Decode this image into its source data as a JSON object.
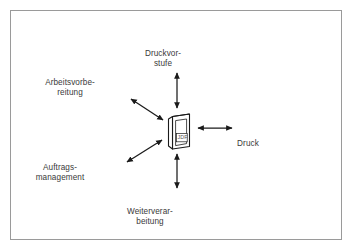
{
  "figure": {
    "type": "hub-and-spoke-diagram",
    "border_color": "#9a9a9a",
    "background_color": "#ffffff",
    "line_color": "#1a1a1a",
    "text_color": "#3a3a3a"
  },
  "center": {
    "icon_name": "jdf-document-icon",
    "label": "JDF"
  },
  "nodes": [
    {
      "id": "druckvorstufe",
      "line1": "Druckvor-",
      "line2": "stufe",
      "direction": "up",
      "x": 163,
      "y": 38
    },
    {
      "id": "arbeitsvorbereitung",
      "line1": "Arbeitsvorbe-",
      "line2": "reitung",
      "direction": "up-left",
      "x": 70,
      "y": 67
    },
    {
      "id": "druck",
      "line1": "Druck",
      "line2": "",
      "direction": "right",
      "x": 248,
      "y": 128
    },
    {
      "id": "auftragsmanagement",
      "line1": "Auftrags-",
      "line2": "management",
      "direction": "down-left",
      "x": 60,
      "y": 152
    },
    {
      "id": "weiterverarbeitung",
      "line1": "Weiterverar-",
      "line2": "beitung",
      "direction": "down",
      "x": 150,
      "y": 196
    }
  ],
  "arrows": [
    {
      "id": "arrow-up",
      "name": "arrow-to-druckvorstufe",
      "double_headed": true
    },
    {
      "id": "arrow-up-left",
      "name": "arrow-to-arbeitsvorbereitung",
      "double_headed": true
    },
    {
      "id": "arrow-right",
      "name": "arrow-to-druck",
      "double_headed": true
    },
    {
      "id": "arrow-down-left",
      "name": "arrow-to-auftragsmanagement",
      "double_headed": true
    },
    {
      "id": "arrow-down",
      "name": "arrow-to-weiterverarbeitung",
      "double_headed": true
    }
  ]
}
